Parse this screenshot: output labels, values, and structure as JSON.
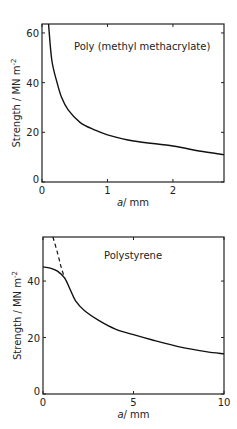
{
  "chart_data": [
    {
      "type": "line",
      "title": "Poly (methyl methacrylate)",
      "xlabel": "a / mm",
      "ylabel": "Strength / MN m^-2",
      "xlim": [
        0,
        2.78
      ],
      "ylim": [
        0,
        63.6
      ],
      "xticks": [
        0,
        1,
        2
      ],
      "yticks": [
        0,
        20,
        40,
        60
      ],
      "xtick_labels": [
        "0",
        "1",
        "2"
      ],
      "ytick_labels": [
        "0",
        "20",
        "40",
        "60"
      ],
      "grid": false,
      "legend": null,
      "series": [
        {
          "name": "Strength",
          "style": "solid",
          "x": [
            0.1,
            0.15,
            0.23,
            0.3,
            0.4,
            0.58,
            0.8,
            1.0,
            1.4,
            2.0,
            2.4,
            2.78
          ],
          "y": [
            63.6,
            49,
            40,
            34,
            29,
            24,
            21,
            19,
            16.5,
            14.5,
            12.5,
            11
          ]
        }
      ]
    },
    {
      "type": "line",
      "title": "Polystyrene",
      "xlabel": "a / mm",
      "ylabel": "Strength / MN m^-2",
      "xlim": [
        0,
        10
      ],
      "ylim": [
        0,
        55.6
      ],
      "xticks": [
        0,
        5,
        10
      ],
      "yticks": [
        0,
        20,
        40
      ],
      "xtick_labels": [
        "0",
        "5",
        "10"
      ],
      "ytick_labels": [
        "0",
        "20",
        "40"
      ],
      "grid": false,
      "legend": null,
      "series": [
        {
          "name": "Strength (measured)",
          "style": "solid",
          "x": [
            0,
            0.4,
            0.8,
            1.2,
            1.5,
            1.8,
            2.3,
            3.1,
            4.0,
            5.0,
            6.0,
            7.6,
            9.0,
            10.0
          ],
          "y": [
            45,
            44.6,
            43.5,
            41,
            37,
            33,
            29.5,
            26,
            23,
            21,
            19.2,
            16.6,
            15,
            14.2
          ]
        },
        {
          "name": "Extrapolated (dashed)",
          "style": "dashed",
          "x": [
            0.55,
            0.8,
            1.0,
            1.2
          ],
          "y": [
            55.6,
            50,
            45,
            41
          ]
        }
      ]
    }
  ],
  "panels": [
    {
      "frame": {
        "x0": 42,
        "x1": 224,
        "y0": 24,
        "y1": 182
      },
      "title_pos": {
        "x": 74,
        "y": 50
      }
    },
    {
      "frame": {
        "x0": 43,
        "x1": 224,
        "y0": 237,
        "y1": 394
      },
      "title_pos": {
        "x": 104,
        "y": 259
      }
    }
  ]
}
